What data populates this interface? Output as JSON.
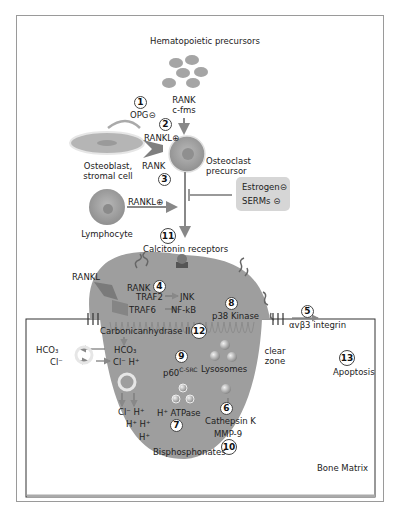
{
  "diagram": {
    "cells": {
      "hematopoietic": "Hematopoietic precursors",
      "rank_cfms": [
        "RANK",
        "c-fms"
      ],
      "osteoblast": [
        "Osteoblast,",
        "stromal cell"
      ],
      "osteoclast_precursor": [
        "Osteoclast",
        "precursor"
      ],
      "lymphocyte": "Lymphocyte"
    },
    "labels": {
      "opg": "OPG⊝",
      "rankl_plus_1": "RANKL⊕",
      "rank_1": "RANK",
      "rankl_plus_2": "RANKL⊕",
      "estrogen": "Estrogen⊝",
      "serms": "SERMs ⊝",
      "calcitonin": "Calcitonin receptors",
      "rankl_2": "RANKL",
      "rank_2": "RANK",
      "traf2": "TRAF2",
      "jnk": "JNK",
      "traf6": "TRAF6",
      "nfkb": "NF-kB",
      "p38": "p38 Kinase",
      "integrin": "αvβ3 integrin",
      "carbonic": "Carbonicanhydrase II",
      "hco3_in": "HCO₃",
      "hco3_out": "HCO₃",
      "cl_out": "Cl⁻",
      "cl_h": "Cl⁻ H⁺",
      "p60": "p60",
      "p60_sup": "C-SRC",
      "lysosomes": "Lysosomes",
      "clear_zone": [
        "clear",
        "zone"
      ],
      "apoptosis": "Apoptosis",
      "cl_h_bottom": "Cl⁻ H⁺",
      "h_h": "H⁺ H⁺",
      "h": "H⁺",
      "atpase": "H⁺ ATPase",
      "cathepsin": "Cathepsin K",
      "mmp9": "MMP-9",
      "bisphosphonates": "Bisphosphonates",
      "bone_matrix": "Bone Matrix"
    },
    "steps": [
      "1",
      "2",
      "3",
      "4",
      "5",
      "6",
      "7",
      "8",
      "9",
      "10",
      "11",
      "12",
      "13"
    ],
    "colors": {
      "cell_fill": "#9e9e9e",
      "cell_dark": "#7d7d7d",
      "arrow": "#8a8a8a",
      "drug_box": "#d6d6d6",
      "frame": "#9a9a9a"
    }
  }
}
